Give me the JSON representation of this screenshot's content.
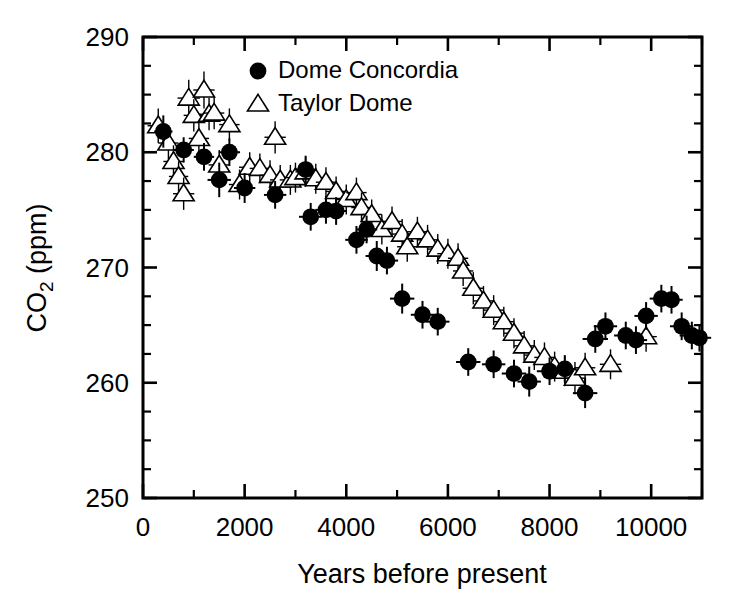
{
  "chart_data": {
    "type": "scatter",
    "title": "",
    "xlabel": "Years before present",
    "ylabel": "CO2 (ppm)",
    "ylabel_display": "CO₂ (ppm)",
    "xlim": [
      0,
      11000
    ],
    "ylim": [
      250,
      290
    ],
    "x_major_ticks": [
      0,
      2000,
      4000,
      6000,
      8000,
      10000
    ],
    "x_tick_labels": [
      "0",
      "2000",
      "4000",
      "6000",
      "8000",
      "10000"
    ],
    "x_minor_step": 1000,
    "y_major_ticks": [
      250,
      260,
      270,
      280,
      290
    ],
    "y_tick_labels": [
      "250",
      "260",
      "270",
      "280",
      "290"
    ],
    "y_minor_step": 2.5,
    "grid": false,
    "legend_position": "top-center",
    "series": [
      {
        "name": "Dome Concordia",
        "marker": "filled-circle",
        "color": "#000000",
        "points": [
          {
            "x": 400,
            "y": 281.8,
            "xerr": 180,
            "yerr": 1.4
          },
          {
            "x": 800,
            "y": 280.2,
            "xerr": 200,
            "yerr": 1.1
          },
          {
            "x": 1200,
            "y": 279.6,
            "xerr": 200,
            "yerr": 1.2
          },
          {
            "x": 1500,
            "y": 277.6,
            "xerr": 230,
            "yerr": 1.5
          },
          {
            "x": 1700,
            "y": 280.0,
            "xerr": 210,
            "yerr": 1.2
          },
          {
            "x": 2000,
            "y": 276.9,
            "xerr": 210,
            "yerr": 1.3
          },
          {
            "x": 2600,
            "y": 276.3,
            "xerr": 220,
            "yerr": 1.2
          },
          {
            "x": 3200,
            "y": 278.5,
            "xerr": 220,
            "yerr": 1.2
          },
          {
            "x": 3300,
            "y": 274.4,
            "xerr": 230,
            "yerr": 1.2
          },
          {
            "x": 3600,
            "y": 275.0,
            "xerr": 210,
            "yerr": 1.2
          },
          {
            "x": 3800,
            "y": 274.9,
            "xerr": 210,
            "yerr": 1.2
          },
          {
            "x": 4200,
            "y": 272.4,
            "xerr": 220,
            "yerr": 1.2
          },
          {
            "x": 4400,
            "y": 273.3,
            "xerr": 210,
            "yerr": 1.2
          },
          {
            "x": 4600,
            "y": 271.0,
            "xerr": 220,
            "yerr": 1.3
          },
          {
            "x": 4800,
            "y": 270.6,
            "xerr": 220,
            "yerr": 1.2
          },
          {
            "x": 5100,
            "y": 267.3,
            "xerr": 240,
            "yerr": 1.3
          },
          {
            "x": 5500,
            "y": 265.9,
            "xerr": 230,
            "yerr": 1.2
          },
          {
            "x": 5800,
            "y": 265.3,
            "xerr": 230,
            "yerr": 1.2
          },
          {
            "x": 6400,
            "y": 261.8,
            "xerr": 240,
            "yerr": 1.2
          },
          {
            "x": 6900,
            "y": 261.6,
            "xerr": 230,
            "yerr": 1.2
          },
          {
            "x": 7300,
            "y": 260.8,
            "xerr": 240,
            "yerr": 1.2
          },
          {
            "x": 7600,
            "y": 260.1,
            "xerr": 230,
            "yerr": 1.3
          },
          {
            "x": 8000,
            "y": 261.0,
            "xerr": 250,
            "yerr": 1.2
          },
          {
            "x": 8300,
            "y": 261.2,
            "xerr": 230,
            "yerr": 1.2
          },
          {
            "x": 8700,
            "y": 259.1,
            "xerr": 240,
            "yerr": 1.3
          },
          {
            "x": 8900,
            "y": 263.8,
            "xerr": 250,
            "yerr": 1.2
          },
          {
            "x": 9100,
            "y": 264.9,
            "xerr": 230,
            "yerr": 1.2
          },
          {
            "x": 9500,
            "y": 264.1,
            "xerr": 230,
            "yerr": 1.2
          },
          {
            "x": 9700,
            "y": 263.7,
            "xerr": 220,
            "yerr": 1.2
          },
          {
            "x": 9900,
            "y": 265.8,
            "xerr": 230,
            "yerr": 1.2
          },
          {
            "x": 10200,
            "y": 267.3,
            "xerr": 230,
            "yerr": 1.2
          },
          {
            "x": 10400,
            "y": 267.2,
            "xerr": 220,
            "yerr": 1.2
          },
          {
            "x": 10600,
            "y": 264.9,
            "xerr": 230,
            "yerr": 1.2
          },
          {
            "x": 10800,
            "y": 264.1,
            "xerr": 240,
            "yerr": 1.2
          },
          {
            "x": 10950,
            "y": 263.9,
            "xerr": 230,
            "yerr": 1.2
          }
        ]
      },
      {
        "name": "Taylor Dome",
        "marker": "open-triangle",
        "color": "#000000",
        "points": [
          {
            "x": 300,
            "y": 282.3,
            "xerr": 210,
            "yerr": 1.5
          },
          {
            "x": 500,
            "y": 280.8,
            "xerr": 200,
            "yerr": 1.4
          },
          {
            "x": 600,
            "y": 279.2,
            "xerr": 200,
            "yerr": 1.4
          },
          {
            "x": 700,
            "y": 277.9,
            "xerr": 190,
            "yerr": 1.3
          },
          {
            "x": 800,
            "y": 276.4,
            "xerr": 210,
            "yerr": 1.4
          },
          {
            "x": 900,
            "y": 284.7,
            "xerr": 220,
            "yerr": 1.6
          },
          {
            "x": 1000,
            "y": 283.2,
            "xerr": 200,
            "yerr": 1.4
          },
          {
            "x": 1100,
            "y": 281.2,
            "xerr": 200,
            "yerr": 1.4
          },
          {
            "x": 1200,
            "y": 285.4,
            "xerr": 210,
            "yerr": 1.6
          },
          {
            "x": 1300,
            "y": 283.3,
            "xerr": 200,
            "yerr": 1.4
          },
          {
            "x": 1400,
            "y": 283.4,
            "xerr": 200,
            "yerr": 1.4
          },
          {
            "x": 1500,
            "y": 278.9,
            "xerr": 210,
            "yerr": 1.3
          },
          {
            "x": 1700,
            "y": 282.4,
            "xerr": 200,
            "yerr": 1.4
          },
          {
            "x": 1900,
            "y": 277.2,
            "xerr": 210,
            "yerr": 1.3
          },
          {
            "x": 2100,
            "y": 278.7,
            "xerr": 210,
            "yerr": 1.3
          },
          {
            "x": 2300,
            "y": 278.6,
            "xerr": 200,
            "yerr": 1.3
          },
          {
            "x": 2500,
            "y": 278.0,
            "xerr": 200,
            "yerr": 1.3
          },
          {
            "x": 2600,
            "y": 281.3,
            "xerr": 210,
            "yerr": 1.4
          },
          {
            "x": 2700,
            "y": 277.6,
            "xerr": 200,
            "yerr": 1.3
          },
          {
            "x": 2900,
            "y": 277.6,
            "xerr": 210,
            "yerr": 1.3
          },
          {
            "x": 3000,
            "y": 277.8,
            "xerr": 200,
            "yerr": 1.3
          },
          {
            "x": 3200,
            "y": 278.3,
            "xerr": 200,
            "yerr": 1.3
          },
          {
            "x": 3400,
            "y": 277.7,
            "xerr": 200,
            "yerr": 1.3
          },
          {
            "x": 3600,
            "y": 277.4,
            "xerr": 200,
            "yerr": 1.3
          },
          {
            "x": 3800,
            "y": 276.6,
            "xerr": 200,
            "yerr": 1.3
          },
          {
            "x": 4000,
            "y": 275.9,
            "xerr": 200,
            "yerr": 1.3
          },
          {
            "x": 4200,
            "y": 276.5,
            "xerr": 200,
            "yerr": 1.3
          },
          {
            "x": 4300,
            "y": 275.2,
            "xerr": 200,
            "yerr": 1.3
          },
          {
            "x": 4500,
            "y": 274.6,
            "xerr": 200,
            "yerr": 1.3
          },
          {
            "x": 4700,
            "y": 273.3,
            "xerr": 200,
            "yerr": 1.3
          },
          {
            "x": 4900,
            "y": 274.0,
            "xerr": 200,
            "yerr": 1.3
          },
          {
            "x": 5100,
            "y": 272.9,
            "xerr": 200,
            "yerr": 1.3
          },
          {
            "x": 5200,
            "y": 271.8,
            "xerr": 200,
            "yerr": 1.3
          },
          {
            "x": 5400,
            "y": 273.1,
            "xerr": 200,
            "yerr": 1.3
          },
          {
            "x": 5600,
            "y": 272.4,
            "xerr": 200,
            "yerr": 1.3
          },
          {
            "x": 5800,
            "y": 271.6,
            "xerr": 200,
            "yerr": 1.3
          },
          {
            "x": 6000,
            "y": 271.2,
            "xerr": 210,
            "yerr": 1.3
          },
          {
            "x": 6200,
            "y": 270.8,
            "xerr": 200,
            "yerr": 1.3
          },
          {
            "x": 6300,
            "y": 269.7,
            "xerr": 200,
            "yerr": 1.3
          },
          {
            "x": 6500,
            "y": 268.2,
            "xerr": 210,
            "yerr": 1.4
          },
          {
            "x": 6700,
            "y": 267.1,
            "xerr": 200,
            "yerr": 1.3
          },
          {
            "x": 6900,
            "y": 266.3,
            "xerr": 200,
            "yerr": 1.3
          },
          {
            "x": 7100,
            "y": 265.3,
            "xerr": 200,
            "yerr": 1.3
          },
          {
            "x": 7300,
            "y": 264.3,
            "xerr": 200,
            "yerr": 1.3
          },
          {
            "x": 7500,
            "y": 263.2,
            "xerr": 200,
            "yerr": 1.3
          },
          {
            "x": 7700,
            "y": 262.4,
            "xerr": 200,
            "yerr": 1.3
          },
          {
            "x": 7900,
            "y": 262.2,
            "xerr": 200,
            "yerr": 1.3
          },
          {
            "x": 8100,
            "y": 261.4,
            "xerr": 200,
            "yerr": 1.3
          },
          {
            "x": 8300,
            "y": 261.0,
            "xerr": 200,
            "yerr": 1.3
          },
          {
            "x": 8500,
            "y": 260.4,
            "xerr": 210,
            "yerr": 1.4
          },
          {
            "x": 8700,
            "y": 261.3,
            "xerr": 200,
            "yerr": 1.3
          },
          {
            "x": 9200,
            "y": 261.6,
            "xerr": 210,
            "yerr": 1.3
          },
          {
            "x": 9900,
            "y": 264.0,
            "xerr": 210,
            "yerr": 1.3
          }
        ]
      }
    ]
  },
  "legend": {
    "entries": [
      {
        "label": "Dome Concordia",
        "marker": "filled-circle"
      },
      {
        "label": "Taylor Dome",
        "marker": "open-triangle"
      }
    ]
  },
  "colors": {
    "axis": "#000000",
    "background": "#ffffff",
    "series_filled": "#000000",
    "series_open": "#000000"
  }
}
